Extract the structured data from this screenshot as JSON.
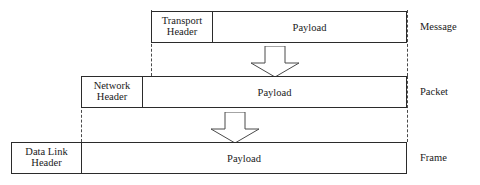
{
  "diagram": {
    "line_color": "#2b2b2b",
    "guide_color": "#4a4a4a",
    "background_color": "#ffffff",
    "rows": [
      {
        "id": "message",
        "header_label": "Transport\nHeader",
        "header_line1": "Transport",
        "header_line2": "Header",
        "payload_label": "Payload",
        "pdu_name": "Message"
      },
      {
        "id": "packet",
        "header_label": "Network\nHeader",
        "header_line1": "Network",
        "header_line2": "Header",
        "payload_label": "Payload",
        "pdu_name": "Packet"
      },
      {
        "id": "frame",
        "header_label": "Data Link\nHeader",
        "header_line1": "Data Link",
        "header_line2": "Header",
        "payload_label": "Payload",
        "pdu_name": "Frame"
      }
    ],
    "arrows": [
      {
        "id": "arrow-message-to-packet",
        "direction": "down"
      },
      {
        "id": "arrow-packet-to-frame",
        "direction": "down"
      }
    ]
  }
}
